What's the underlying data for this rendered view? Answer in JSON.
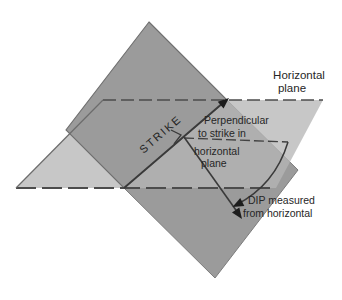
{
  "diagram": {
    "labels": {
      "horizontal_plane": [
        "Horizontal",
        "plane"
      ],
      "strike": "STRIKE",
      "perpendicular_to_strike": [
        "Perpendicular",
        "to strike in",
        "horizontal",
        "plane"
      ],
      "dip": [
        "DIP measured",
        "from horizontal"
      ]
    },
    "colors": {
      "dipping_plane": "#9b9b9b",
      "horizontal_plane": "#b5b5b5",
      "edge_line": "#4c4c4c",
      "annotation_line": "#3a3a3a",
      "background": "#ffffff"
    }
  }
}
